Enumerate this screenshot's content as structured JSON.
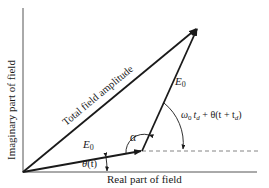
{
  "diagram": {
    "axes": {
      "x_label": "Real part of field",
      "y_label": "Imaginary part of field"
    },
    "vectors": [
      {
        "name": "first-E0",
        "label": "E",
        "subscript": "0"
      },
      {
        "name": "second-E0",
        "label": "E",
        "subscript": "0"
      },
      {
        "name": "total",
        "label": "Total field amplitude"
      }
    ],
    "angles": {
      "theta": {
        "symbol": "θ",
        "arg": "(t)"
      },
      "alpha": {
        "symbol": "α"
      },
      "phase": {
        "omega": "ω",
        "omega_sub": "0",
        "t": "t",
        "t_sub": "d",
        "rest": " + θ(t + t",
        "rest_sub": "d",
        "close": ")"
      }
    },
    "colors": {
      "line": "#1a1a1a",
      "background": "#ffffff"
    }
  }
}
